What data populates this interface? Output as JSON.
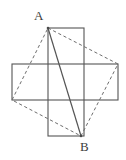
{
  "figure": {
    "width": 126,
    "height": 160,
    "background_color": "#ffffff",
    "stroke_color": "#555555",
    "dashed_stroke_color": "#6e6e6e",
    "label_color": "#3d3d3d",
    "labels": {
      "a": "A",
      "b": "B"
    },
    "points": {
      "A": {
        "x": 48,
        "y": 28
      },
      "B": {
        "x": 81,
        "y": 136
      },
      "horizontal_top_right": {
        "x": 118,
        "y": 64
      },
      "horizontal_bottom_left": {
        "x": 12,
        "y": 100
      }
    },
    "vertical_rectangle": {
      "x": 48,
      "y": 28,
      "width": 36,
      "height": 108
    },
    "horizontal_rectangle": {
      "x": 12,
      "y": 64,
      "width": 106,
      "height": 36
    },
    "solid_segment": {
      "from": "A",
      "to": "B"
    },
    "dashed_quadrilateral": [
      "A",
      "horizontal_top_right",
      "B",
      "horizontal_bottom_left"
    ]
  }
}
